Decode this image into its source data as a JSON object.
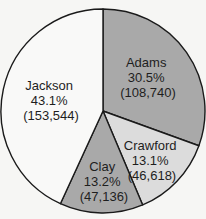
{
  "chart_data": {
    "type": "pie",
    "title": "",
    "start_angle_deg": 0,
    "direction": "clockwise",
    "categories": [
      "Adams",
      "Crawford",
      "Clay",
      "Jackson"
    ],
    "values": [
      108740,
      46618,
      47136,
      153544
    ],
    "percentages": [
      30.5,
      13.1,
      13.2,
      43.1
    ],
    "labels": [
      {
        "name": "Adams",
        "pct": "30.5%",
        "count": "(108,740)"
      },
      {
        "name": "Crawford",
        "pct": "13.1%",
        "count": "(46,618)"
      },
      {
        "name": "Clay",
        "pct": "13.2%",
        "count": "(47,136)"
      },
      {
        "name": "Jackson",
        "pct": "43.1%",
        "count": "(153,544)"
      }
    ],
    "colors": [
      "#a9a9a9",
      "#dcdcdc",
      "#a9a9a9",
      "#f9f9f8"
    ],
    "legend": "none"
  }
}
